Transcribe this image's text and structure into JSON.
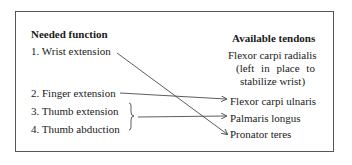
{
  "left_column": {
    "heading": "Needed function",
    "items": [
      {
        "label": "1. Wrist extension"
      },
      {
        "label": "2. Finger extension"
      },
      {
        "label": "3. Thumb extension"
      },
      {
        "label": "4. Thumb abduction"
      }
    ]
  },
  "right_column": {
    "heading": "Available tendons",
    "items": [
      {
        "label": "Flexor carpi radialis",
        "note_line1": "(left in place to",
        "note_line2": "stabilize wrist)"
      },
      {
        "label": "Flexor carpi ulnaris"
      },
      {
        "label": "Palmaris longus"
      },
      {
        "label": "Pronator teres"
      }
    ]
  },
  "connections": [
    {
      "from": "1. Wrist extension",
      "to": "Pronator teres"
    },
    {
      "from": "2. Finger extension",
      "to": "Flexor carpi ulnaris"
    },
    {
      "from": "3. Thumb extension + 4. Thumb abduction",
      "to": "Palmaris longus"
    }
  ],
  "colors": {
    "line": "#333333",
    "border": "#555555",
    "text": "#1a1a1a"
  }
}
